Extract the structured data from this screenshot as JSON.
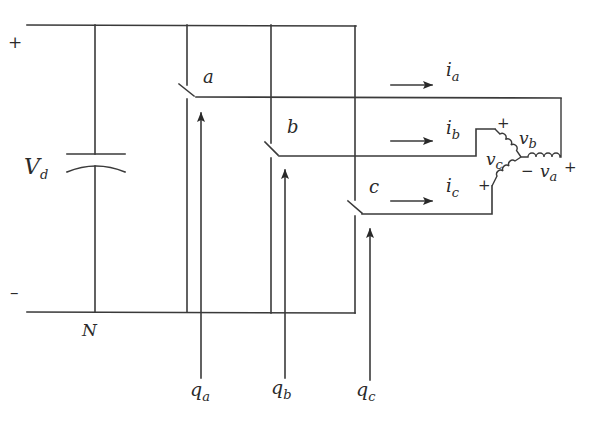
{
  "diagram": {
    "type": "three-phase inverter circuit",
    "source": {
      "label": "V",
      "label_sub": "d",
      "plus": "+",
      "minus": "–",
      "neutral_label": "N"
    },
    "switches": [
      {
        "label": "a",
        "gate_label": "q",
        "gate_sub": "a"
      },
      {
        "label": "b",
        "gate_label": "q",
        "gate_sub": "b"
      },
      {
        "label": "c",
        "gate_label": "q",
        "gate_sub": "c"
      }
    ],
    "currents": [
      {
        "label": "i",
        "sub": "a"
      },
      {
        "label": "i",
        "sub": "b"
      },
      {
        "label": "i",
        "sub": "c"
      }
    ],
    "load": {
      "voltages": [
        {
          "label": "v",
          "sub": "a",
          "plus": "+",
          "minus": "−"
        },
        {
          "label": "v",
          "sub": "b",
          "plus": "+"
        },
        {
          "label": "v",
          "sub": "c",
          "plus": "+"
        }
      ]
    },
    "colors": {
      "line": "#3a3a3a",
      "background": "#ffffff"
    }
  }
}
